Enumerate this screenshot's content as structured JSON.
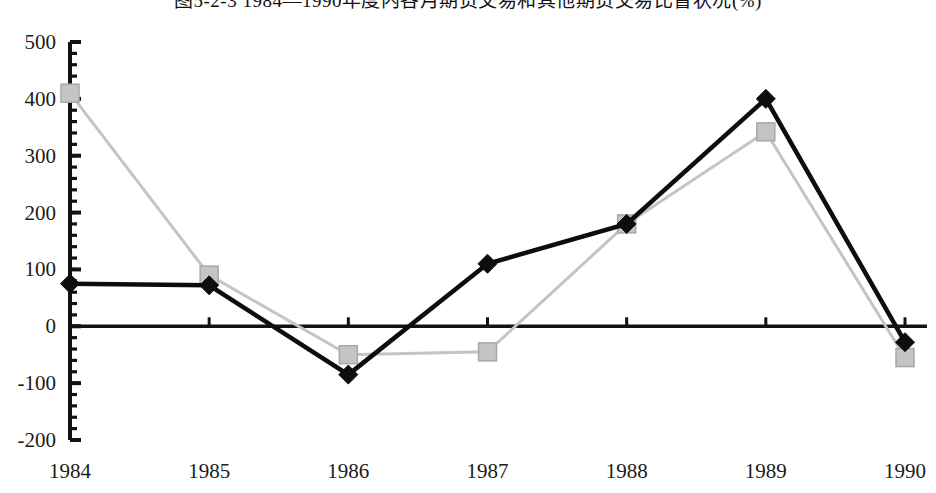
{
  "chart_data": {
    "type": "line",
    "title": "图5-2-3  1984—1990年度内各月期货交易和其他期货交易比督状况(%)",
    "xlabel": "",
    "ylabel": "",
    "categories": [
      "1984",
      "1985",
      "1986",
      "1987",
      "1988",
      "1989",
      "1990"
    ],
    "x": [
      1984,
      1985,
      1986,
      1987,
      1988,
      1989,
      1990
    ],
    "series": [
      {
        "name": "series-black-diamond",
        "marker": "diamond",
        "color": "#0d0d0d",
        "values": [
          75,
          72,
          -85,
          110,
          180,
          400,
          -28
        ]
      },
      {
        "name": "series-gray-square",
        "marker": "square",
        "color": "#c4c4c4",
        "values": [
          410,
          90,
          -50,
          -45,
          180,
          342,
          -55
        ]
      }
    ],
    "ylim": [
      -200,
      500
    ],
    "ytick_labels": [
      "500",
      "400",
      "300",
      "200",
      "100",
      "0",
      "-100",
      "-200"
    ],
    "ytick_values": [
      500,
      400,
      300,
      200,
      100,
      0,
      -100,
      -200
    ],
    "yminor_step": 20,
    "grid": false,
    "legend": null,
    "zero_line": 0
  },
  "colors": {
    "axis": "#121212",
    "series_primary": "#0d0d0d",
    "series_secondary": "#c4c4c4",
    "marker_secondary_edge": "#a8a8a8",
    "background": "#ffffff",
    "text": "#1b1b1b"
  }
}
